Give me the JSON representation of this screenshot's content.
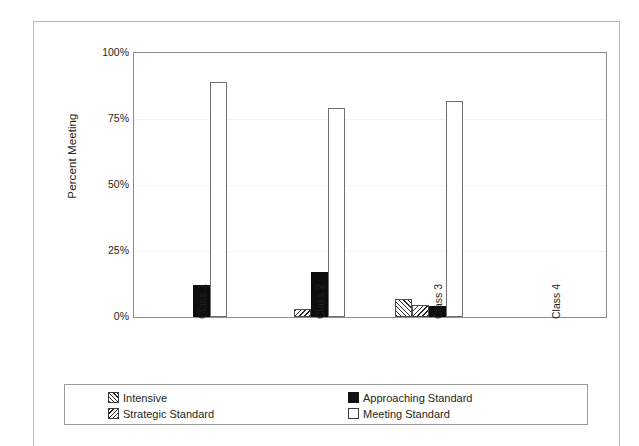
{
  "figure": {
    "y_axis_title": "Percent Meeting"
  },
  "chart_data": {
    "type": "bar",
    "title": "",
    "xlabel": "",
    "ylabel": "Percent Meeting",
    "ylim": [
      0,
      100
    ],
    "ytick_labels": [
      "100%",
      "75%",
      "50%",
      "25%",
      "0%"
    ],
    "ytick_values": [
      100,
      75,
      50,
      25,
      0
    ],
    "grid": true,
    "legend_position": "bottom",
    "categories": [
      "Class 1",
      "Class 2",
      "Class 3",
      "Class 4"
    ],
    "series": [
      {
        "name": "Intensive",
        "values": [
          0,
          0,
          7,
          0
        ]
      },
      {
        "name": "Strategic Standard",
        "values": [
          0,
          3,
          4.5,
          0
        ]
      },
      {
        "name": "Approaching Standard",
        "values": [
          12,
          17,
          4,
          0
        ]
      },
      {
        "name": "Meeting Standard",
        "values": [
          89,
          79,
          82,
          0
        ]
      }
    ]
  },
  "legend": {
    "items": [
      {
        "label": "Intensive",
        "swatch": "hatch-backslash-swatch"
      },
      {
        "label": "Approaching Standard",
        "swatch": "solid-black-swatch"
      },
      {
        "label": "Strategic Standard",
        "swatch": "hatch-forwardslash-swatch"
      },
      {
        "label": "Meeting Standard",
        "swatch": "outline-white-swatch"
      }
    ]
  }
}
